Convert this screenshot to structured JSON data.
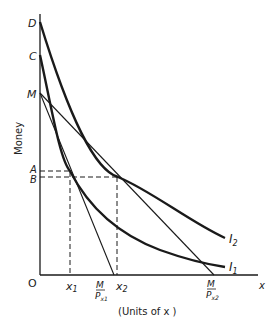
{
  "diagram": {
    "y_axis_label": "Money",
    "x_axis_label": "x",
    "x_axis_caption": "(Units of x )",
    "origin_label": "O",
    "y_labels": {
      "D": "D",
      "C": "C",
      "M": "M",
      "A": "A",
      "B": "B"
    },
    "x_labels": {
      "x1": "x",
      "x1_sub": "1",
      "x2": "x",
      "x2_sub": "2",
      "m_px1_num": "M",
      "m_px1_den": "P",
      "m_px1_sub": "x1",
      "m_px2_num": "M",
      "m_px2_den": "P",
      "m_px2_sub": "x2"
    },
    "curves": {
      "I1": {
        "label": "I",
        "sub": "1"
      },
      "I2": {
        "label": "I",
        "sub": "2"
      }
    },
    "colors": {
      "line": "#1a1a1a",
      "background": "#ffffff"
    }
  }
}
